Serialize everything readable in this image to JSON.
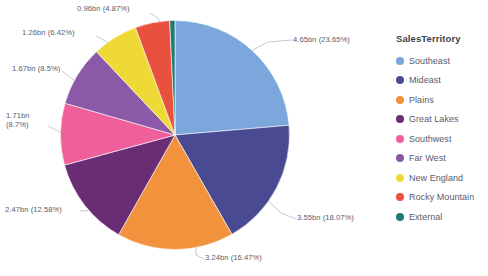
{
  "chart_data": {
    "type": "pie",
    "title": "",
    "legend_title": "SalesTerritory",
    "legend_position": "right",
    "categories": [
      "Southeast",
      "Mideast",
      "Plains",
      "Great Lakes",
      "Southwest",
      "Far West",
      "New England",
      "Rocky Mountain",
      "External"
    ],
    "values": [
      4.65,
      3.55,
      3.24,
      2.47,
      1.71,
      1.67,
      1.26,
      0.96,
      0.15
    ],
    "percents": [
      23.65,
      18.07,
      16.47,
      12.58,
      8.7,
      8.5,
      6.42,
      4.87,
      0.74
    ],
    "value_unit": "bn",
    "colors": [
      "#7ba7dd",
      "#4a4a93",
      "#f2923c",
      "#6a2d73",
      "#ef5f9b",
      "#8a59a8",
      "#efd936",
      "#e8513d",
      "#1f7a78"
    ],
    "labels": [
      {
        "text": "4.65bn (23.65%)",
        "series": "Southeast"
      },
      {
        "text": "3.55bn (18.07%)",
        "series": "Mideast"
      },
      {
        "text": "3.24bn (16.47%)",
        "series": "Plains"
      },
      {
        "text": "2.47bn (12.58%)",
        "series": "Great Lakes"
      },
      {
        "text": "1.71bn\n(8.7%)",
        "series": "Southwest"
      },
      {
        "text": "1.67bn (8.5%)",
        "series": "Far West"
      },
      {
        "text": "1.26bn (6.42%)",
        "series": "New England"
      },
      {
        "text": "0.96bn (4.87%)",
        "series": "Rocky Mountain"
      }
    ]
  },
  "callouts": {
    "southeast": "4.65bn (23.65%)",
    "mideast": "3.55bn (18.07%)",
    "plains": "3.24bn (16.47%)",
    "great_lakes": "2.47bn (12.58%)",
    "southwest_line1": "1.71bn",
    "southwest_line2": "(8.7%)",
    "far_west": "1.67bn (8.5%)",
    "new_england": "1.26bn (6.42%)",
    "rocky_mountain": "0.96bn (4.87%)"
  },
  "legend": {
    "title": "SalesTerritory",
    "items": [
      {
        "label": "Southeast",
        "color": "#7ba7dd"
      },
      {
        "label": "Mideast",
        "color": "#4a4a93"
      },
      {
        "label": "Plains",
        "color": "#f2923c"
      },
      {
        "label": "Great Lakes",
        "color": "#6a2d73"
      },
      {
        "label": "Southwest",
        "color": "#ef5f9b"
      },
      {
        "label": "Far West",
        "color": "#8a59a8"
      },
      {
        "label": "New England",
        "color": "#efd936"
      },
      {
        "label": "Rocky Mountain",
        "color": "#e8513d"
      },
      {
        "label": "External",
        "color": "#1f7a78"
      }
    ]
  }
}
